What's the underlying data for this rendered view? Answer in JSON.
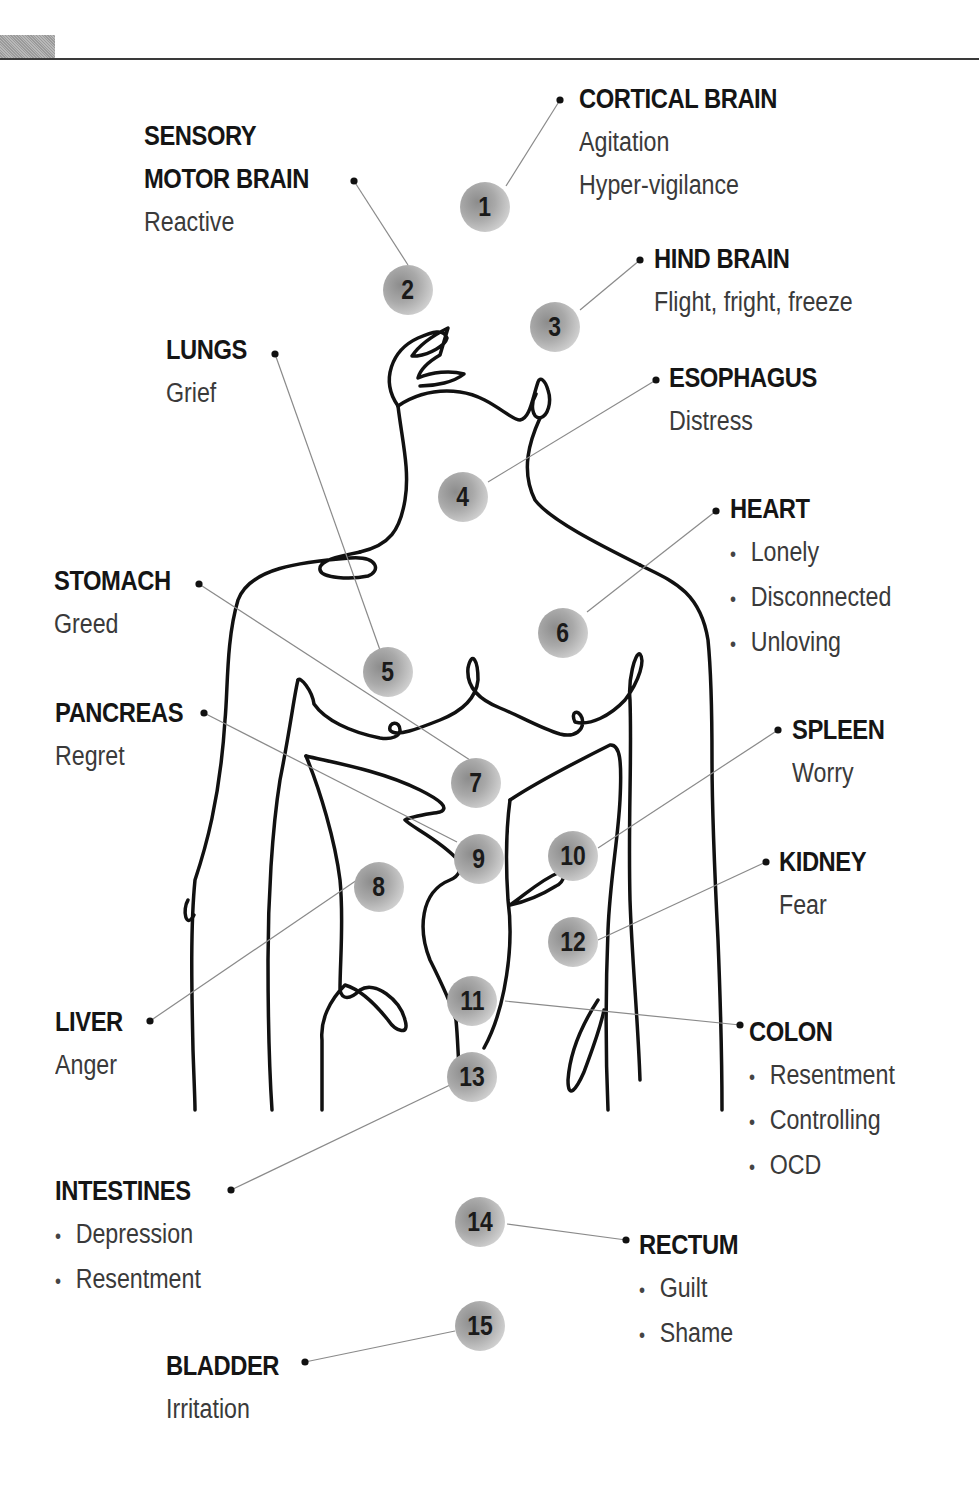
{
  "header": {
    "tab_color": "#a8a8a8",
    "rule_color": "#3a3a3a"
  },
  "markers": [
    {
      "n": "1",
      "x": 460,
      "y": 182
    },
    {
      "n": "2",
      "x": 383,
      "y": 265
    },
    {
      "n": "3",
      "x": 530,
      "y": 302
    },
    {
      "n": "4",
      "x": 438,
      "y": 472
    },
    {
      "n": "5",
      "x": 363,
      "y": 647
    },
    {
      "n": "6",
      "x": 538,
      "y": 608
    },
    {
      "n": "7",
      "x": 451,
      "y": 758
    },
    {
      "n": "8",
      "x": 354,
      "y": 862
    },
    {
      "n": "9",
      "x": 454,
      "y": 834
    },
    {
      "n": "10",
      "x": 548,
      "y": 831
    },
    {
      "n": "11",
      "x": 447,
      "y": 976
    },
    {
      "n": "12",
      "x": 548,
      "y": 917
    },
    {
      "n": "13",
      "x": 447,
      "y": 1052
    },
    {
      "n": "14",
      "x": 455,
      "y": 1197
    },
    {
      "n": "15",
      "x": 455,
      "y": 1301
    }
  ],
  "labels": [
    {
      "id": "cortical-brain",
      "title": "CORTICAL BRAIN",
      "lines": [
        "Agitation",
        "Hyper-vigilance"
      ],
      "bullets": false,
      "x": 579,
      "y": 78
    },
    {
      "id": "sensory-motor-brain",
      "title": "SENSORY",
      "title2": "MOTOR BRAIN",
      "lines": [
        "Reactive"
      ],
      "bullets": false,
      "x": 144,
      "y": 115
    },
    {
      "id": "hind-brain",
      "title": "HIND BRAIN",
      "lines": [
        "Flight, fright, freeze"
      ],
      "bullets": false,
      "x": 654,
      "y": 238
    },
    {
      "id": "lungs",
      "title": "LUNGS",
      "lines": [
        "Grief"
      ],
      "bullets": false,
      "x": 166,
      "y": 329
    },
    {
      "id": "esophagus",
      "title": "ESOPHAGUS",
      "lines": [
        "Distress"
      ],
      "bullets": false,
      "x": 669,
      "y": 357
    },
    {
      "id": "heart",
      "title": "HEART",
      "lines": [
        "Lonely",
        "Disconnected",
        "Unloving"
      ],
      "bullets": true,
      "x": 730,
      "y": 488
    },
    {
      "id": "stomach",
      "title": "STOMACH",
      "lines": [
        "Greed"
      ],
      "bullets": false,
      "x": 54,
      "y": 560
    },
    {
      "id": "pancreas",
      "title": "PANCREAS",
      "lines": [
        "Regret"
      ],
      "bullets": false,
      "x": 55,
      "y": 692
    },
    {
      "id": "spleen",
      "title": "SPLEEN",
      "lines": [
        "Worry"
      ],
      "bullets": false,
      "x": 792,
      "y": 709
    },
    {
      "id": "kidney",
      "title": "KIDNEY",
      "lines": [
        "Fear"
      ],
      "bullets": false,
      "x": 779,
      "y": 841
    },
    {
      "id": "liver",
      "title": "LIVER",
      "lines": [
        "Anger"
      ],
      "bullets": false,
      "x": 55,
      "y": 1001
    },
    {
      "id": "colon",
      "title": "COLON",
      "lines": [
        "Resentment",
        "Controlling",
        "OCD"
      ],
      "bullets": true,
      "x": 749,
      "y": 1011
    },
    {
      "id": "intestines",
      "title": "INTESTINES",
      "lines": [
        "Depression",
        "Resentment"
      ],
      "bullets": true,
      "x": 55,
      "y": 1170
    },
    {
      "id": "rectum",
      "title": "RECTUM",
      "lines": [
        "Guilt",
        "Shame"
      ],
      "bullets": true,
      "x": 639,
      "y": 1224
    },
    {
      "id": "bladder",
      "title": "BLADDER",
      "lines": [
        "Irritation"
      ],
      "bullets": false,
      "x": 166,
      "y": 1345
    }
  ],
  "connectors": [
    {
      "from": [
        506,
        186
      ],
      "to": [
        560,
        100
      ]
    },
    {
      "from": [
        408,
        265
      ],
      "to": [
        354,
        181
      ]
    },
    {
      "from": [
        580,
        310
      ],
      "to": [
        640,
        260
      ]
    },
    {
      "from": [
        488,
        482
      ],
      "to": [
        656,
        380
      ]
    },
    {
      "from": [
        380,
        650
      ],
      "to": [
        275,
        354
      ]
    },
    {
      "from": [
        587,
        612
      ],
      "to": [
        716,
        511
      ]
    },
    {
      "from": [
        470,
        760
      ],
      "to": [
        199,
        584
      ]
    },
    {
      "from": [
        357,
        880
      ],
      "to": [
        150,
        1021
      ]
    },
    {
      "from": [
        457,
        842
      ],
      "to": [
        204,
        713
      ]
    },
    {
      "from": [
        598,
        848
      ],
      "to": [
        778,
        730
      ]
    },
    {
      "from": [
        505,
        1001
      ],
      "to": [
        740,
        1025
      ]
    },
    {
      "from": [
        598,
        940
      ],
      "to": [
        766,
        862
      ]
    },
    {
      "from": [
        450,
        1085
      ],
      "to": [
        231,
        1190
      ]
    },
    {
      "from": [
        507,
        1224
      ],
      "to": [
        626,
        1240
      ]
    },
    {
      "from": [
        455,
        1331
      ],
      "to": [
        305,
        1362
      ]
    }
  ]
}
